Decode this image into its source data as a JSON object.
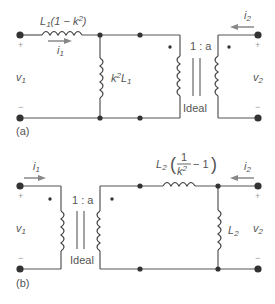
{
  "circuit_a": {
    "caption": "(a)",
    "series_inductor": {
      "label_prefix": "L",
      "label_sub": "1",
      "label_suffix": "(1 − k",
      "label_sup": "2",
      "label_end": ")"
    },
    "shunt_inductor": {
      "label_prefix": "k",
      "label_sup": "2",
      "label_mid": "L",
      "label_sub": "1"
    },
    "transformer": {
      "ratio": "1 : a",
      "type_label": "Ideal"
    },
    "port1": {
      "current_label": "i",
      "current_sub": "1",
      "voltage_label": "v",
      "voltage_sub": "1",
      "plus": "+",
      "minus": "−"
    },
    "port2": {
      "current_label": "i",
      "current_sub": "2",
      "voltage_label": "v",
      "voltage_sub": "2",
      "plus": "+",
      "minus": "−"
    }
  },
  "circuit_b": {
    "caption": "(b)",
    "series_inductor": {
      "label_prefix": "L",
      "label_sub": "2",
      "frac_num": "1",
      "frac_den": "k",
      "frac_den_sup": "2",
      "label_tail": "− 1"
    },
    "shunt_inductor": {
      "label_prefix": "L",
      "label_sub": "2"
    },
    "transformer": {
      "ratio": "1 : a",
      "type_label": "Ideal"
    },
    "port1": {
      "current_label": "i",
      "current_sub": "1",
      "voltage_label": "v",
      "voltage_sub": "1",
      "plus": "+",
      "minus": "−"
    },
    "port2": {
      "current_label": "i",
      "current_sub": "2",
      "voltage_label": "v",
      "voltage_sub": "2",
      "plus": "+",
      "minus": "−"
    }
  },
  "colors": {
    "wire": "#555555",
    "arrow": "#888888",
    "terminal": "#333333"
  }
}
